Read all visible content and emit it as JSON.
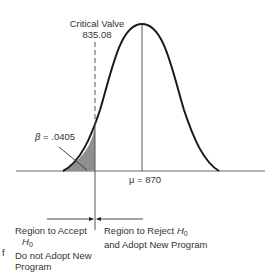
{
  "diagram": {
    "type": "normal-distribution-hypothesis-test",
    "critical": {
      "label": "Critical Valve",
      "value": "835.08"
    },
    "beta": {
      "symbol": "β",
      "text": " = .0405"
    },
    "mean": {
      "label": "μ = 870"
    },
    "accept_region": {
      "line1": "Region to Accept",
      "h": "H",
      "h_sub": "0",
      "line3": "Do not Adopt New",
      "line4": "Program"
    },
    "reject_region": {
      "line1": "Region to Reject ",
      "h": "H",
      "h_sub": "0",
      "line2": "and Adopt New Program"
    },
    "stray_text": "f",
    "colors": {
      "shade": "#8f8f8f",
      "line": "#1a1a1a",
      "axis": "#555555"
    }
  }
}
